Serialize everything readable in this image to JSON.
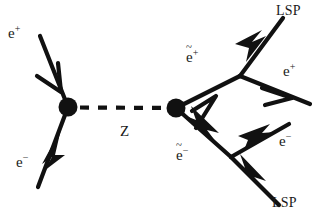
{
  "figure": {
    "kind": "feynman-diagram",
    "background_color": "#ffffff",
    "line_color": "#111111"
  },
  "labels": {
    "incoming_positron": {
      "base": "e",
      "charge": "+",
      "tilde": false,
      "text": "e+"
    },
    "incoming_electron": {
      "base": "e",
      "charge": "−",
      "tilde": false,
      "text": "e−"
    },
    "propagator": {
      "text": "Z"
    },
    "selectron_plus": {
      "base": "e",
      "charge": "+",
      "tilde": true,
      "text": "ẽ+"
    },
    "selectron_minus": {
      "base": "e",
      "charge": "−",
      "tilde": true,
      "text": "ẽ−"
    },
    "lsp_top": {
      "text": "LSP"
    },
    "lsp_bottom": {
      "text": "LSP"
    },
    "outgoing_positron": {
      "base": "e",
      "charge": "+",
      "tilde": false,
      "text": "e+"
    },
    "outgoing_electron": {
      "base": "e",
      "charge": "−",
      "tilde": false,
      "text": "e−"
    }
  },
  "vertices": {
    "production_left": {
      "x": 68,
      "y": 107,
      "r": 9
    },
    "production_right": {
      "x": 176,
      "y": 108,
      "r": 9
    },
    "decay_top": {
      "x": 240,
      "y": 76
    },
    "decay_bottom": {
      "x": 231,
      "y": 157
    }
  },
  "legend": {
    "solid_line": "fermion",
    "dashed_line": "Z boson propagator",
    "filled_dot": "interaction vertex",
    "arrowhead": "fermion flow direction"
  }
}
